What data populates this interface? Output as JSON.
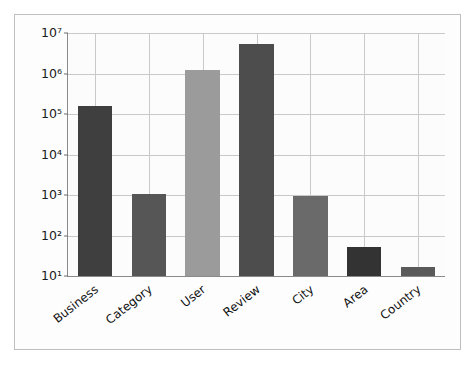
{
  "chart_data": {
    "type": "bar",
    "title": "",
    "xlabel": "",
    "ylabel": "",
    "yscale": "log",
    "ylim": [
      10,
      10000000
    ],
    "grid": true,
    "legend": null,
    "ytick_labels": [
      "10⁷",
      "10⁶",
      "10⁵",
      "10⁴",
      "10³",
      "10²",
      "10¹"
    ],
    "ytick_values": [
      10000000,
      1000000,
      100000,
      10000,
      1000,
      100,
      10
    ],
    "categories": [
      "Business",
      "Category",
      "User",
      "Review",
      "City",
      "Area",
      "Country"
    ],
    "values": [
      160000,
      1050,
      1250000,
      5400000,
      950,
      52,
      17
    ],
    "bar_colors": [
      "#3f3f3f",
      "#565656",
      "#9b9b9b",
      "#4d4d4d",
      "#6a6a6a",
      "#333333",
      "#5a5a5a"
    ]
  },
  "figure": {
    "background": "#fdfdfd",
    "border_color": "#bfbfbf",
    "axis_color": "#8a8a8a",
    "grid_color": "#c9c9c9"
  }
}
